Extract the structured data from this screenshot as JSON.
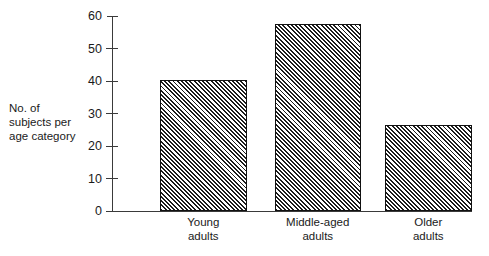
{
  "chart_data": {
    "type": "bar",
    "title": "",
    "subtitle": "",
    "xlabel": "",
    "ylabel": "No. of subjects per age category",
    "ylabel_lines": [
      "No. of",
      "subjects per",
      "age category"
    ],
    "categories": [
      "Young adults",
      "Middle-aged adults",
      "Older adults"
    ],
    "category_lines": [
      [
        "Young",
        "adults"
      ],
      [
        "Middle-aged",
        "adults"
      ],
      [
        "Older",
        "adults"
      ]
    ],
    "values": [
      40.5,
      57.5,
      26.5
    ],
    "ylim": [
      0,
      60
    ],
    "yticks": [
      0,
      10,
      20,
      30,
      40,
      50,
      60
    ],
    "ytick_labels": [
      "0",
      "10",
      "20",
      "30",
      "40",
      "50",
      "60"
    ],
    "grid": false,
    "legend": false,
    "legend_position": "none",
    "bar_fill": "diagonal-hatch",
    "colors": {
      "bar_hatch": "#1c1c1c",
      "bar_background": "#ffffff",
      "bar_border": "#111111",
      "axis": "#3a3a3a",
      "text": "#1a1a1a",
      "page_background": "#ffffff"
    }
  }
}
